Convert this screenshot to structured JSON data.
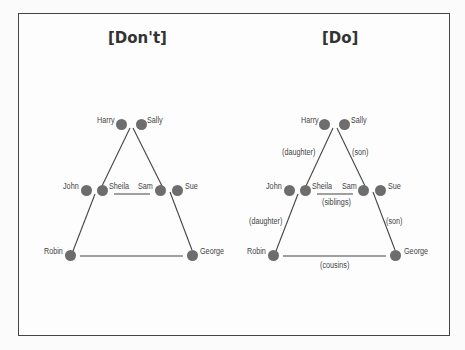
{
  "panels": [
    {
      "title": "[Don't]",
      "names": {
        "harry": "Harry",
        "sally": "Sally",
        "john": "John",
        "sheila": "Sheila",
        "sam": "Sam",
        "sue": "Sue",
        "robin": "Robin",
        "george": "George"
      },
      "relations": {}
    },
    {
      "title": "[Do]",
      "names": {
        "harry": "Harry",
        "sally": "Sally",
        "john": "John",
        "sheila": "Sheila",
        "sam": "Sam",
        "sue": "Sue",
        "robin": "Robin",
        "george": "George"
      },
      "relations": {
        "sheila_parent": "(daughter)",
        "sam_parent": "(son)",
        "siblings": "(siblings)",
        "robin_parent": "(daughter)",
        "george_parent": "(son)",
        "cousins": "(cousins)"
      }
    }
  ],
  "colors": {
    "node": "#6d6d6d",
    "line": "#444444",
    "text": "#444444"
  }
}
